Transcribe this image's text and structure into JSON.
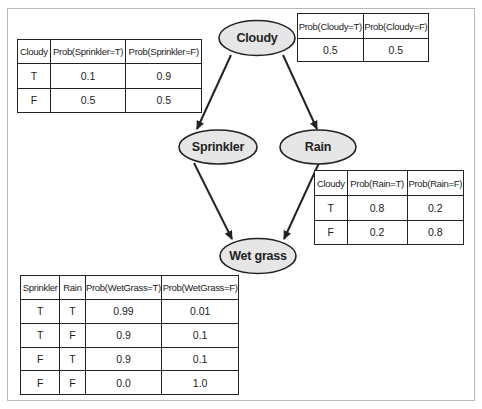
{
  "diagram": {
    "type": "bayesian-network",
    "nodes": {
      "cloudy": {
        "label": "Cloudy"
      },
      "sprinkler": {
        "label": "Sprinkler"
      },
      "rain": {
        "label": "Rain"
      },
      "wetgrass": {
        "label": "Wet grass"
      }
    },
    "edges": [
      {
        "from": "Cloudy",
        "to": "Sprinkler"
      },
      {
        "from": "Cloudy",
        "to": "Rain"
      },
      {
        "from": "Sprinkler",
        "to": "Wet grass"
      },
      {
        "from": "Rain",
        "to": "Wet grass"
      }
    ],
    "colors": {
      "node_fill": "#e6e6e6",
      "stroke": "#222222",
      "frame": "#b8b8b8"
    }
  },
  "tables": {
    "cloudy": {
      "headers": [
        "Prob(Cloudy=T)",
        "Prob(Cloudy=F)"
      ],
      "rows": [
        [
          "0.5",
          "0.5"
        ]
      ]
    },
    "sprinkler": {
      "headers": [
        "Cloudy",
        "Prob(Sprinkler=T)",
        "Prob(Sprinkler=F)"
      ],
      "rows": [
        [
          "T",
          "0.1",
          "0.9"
        ],
        [
          "F",
          "0.5",
          "0.5"
        ]
      ]
    },
    "rain": {
      "headers": [
        "Cloudy",
        "Prob(Rain=T)",
        "Prob(Rain=F)"
      ],
      "rows": [
        [
          "T",
          "0.8",
          "0.2"
        ],
        [
          "F",
          "0.2",
          "0.8"
        ]
      ]
    },
    "wetgrass": {
      "headers": [
        "Sprinkler",
        "Rain",
        "Prob(WetGrass=T)",
        "Prob(WetGrass=F)"
      ],
      "rows": [
        [
          "T",
          "T",
          "0.99",
          "0.01"
        ],
        [
          "T",
          "F",
          "0.9",
          "0.1"
        ],
        [
          "F",
          "T",
          "0.9",
          "0.1"
        ],
        [
          "F",
          "F",
          "0.0",
          "1.0"
        ]
      ]
    }
  }
}
